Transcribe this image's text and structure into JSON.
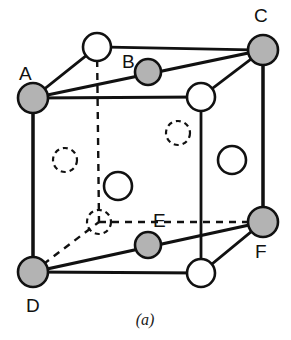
{
  "figure": {
    "caption": "(a)",
    "type": "crystal-unit-cell-diagram",
    "colors": {
      "line": "#111111",
      "shaded_atom_fill": "#b3b3b3",
      "open_atom_fill": "#ffffff",
      "background": "#ffffff"
    },
    "labels": [
      {
        "id": "label-A",
        "text": "A",
        "x": 19,
        "y": 80
      },
      {
        "id": "label-B",
        "text": "B",
        "x": 122,
        "y": 68
      },
      {
        "id": "label-C",
        "text": "C",
        "x": 254,
        "y": 22
      },
      {
        "id": "label-D",
        "text": "D",
        "x": 26,
        "y": 312
      },
      {
        "id": "label-E",
        "text": "E",
        "x": 153,
        "y": 227
      },
      {
        "id": "label-F",
        "text": "F",
        "x": 255,
        "y": 258
      }
    ],
    "atoms": [
      {
        "id": "atom-A",
        "label": "A",
        "style": "shaded",
        "cx": 33,
        "cy": 98,
        "r": 15
      },
      {
        "id": "atom-C",
        "label": "C",
        "style": "shaded",
        "cx": 263,
        "cy": 50,
        "r": 15
      },
      {
        "id": "atom-D",
        "label": "D",
        "style": "shaded",
        "cx": 33,
        "cy": 272,
        "r": 15
      },
      {
        "id": "atom-F",
        "label": "F",
        "style": "shaded",
        "cx": 263,
        "cy": 222,
        "r": 15
      },
      {
        "id": "atom-B",
        "label": "B",
        "style": "shaded",
        "cx": 148,
        "cy": 72,
        "r": 13
      },
      {
        "id": "atom-E",
        "label": "E",
        "style": "shaded",
        "cx": 148,
        "cy": 245,
        "r": 13
      },
      {
        "id": "atom-back-top-left",
        "label": "",
        "style": "open",
        "cx": 97,
        "cy": 47,
        "r": 14
      },
      {
        "id": "atom-front-top-right",
        "label": "",
        "style": "open",
        "cx": 201,
        "cy": 97,
        "r": 14
      },
      {
        "id": "atom-front-bottom-right",
        "label": "",
        "style": "open",
        "cx": 201,
        "cy": 273,
        "r": 14
      },
      {
        "id": "atom-face-right",
        "label": "",
        "style": "open",
        "cx": 232,
        "cy": 160,
        "r": 14
      },
      {
        "id": "atom-face-front",
        "label": "",
        "style": "open",
        "cx": 118,
        "cy": 186,
        "r": 14
      },
      {
        "id": "atom-face-left-hidden",
        "label": "",
        "style": "dashed",
        "cx": 65,
        "cy": 160,
        "r": 12
      },
      {
        "id": "atom-face-back-hidden",
        "label": "",
        "style": "dashed",
        "cx": 178,
        "cy": 133,
        "r": 12
      },
      {
        "id": "atom-face-bottom-hidden",
        "label": "",
        "style": "dashed",
        "cx": 99,
        "cy": 222,
        "r": 12
      }
    ],
    "edges_solid": [
      {
        "id": "edge-front-left",
        "x1": 33,
        "y1": 98,
        "x2": 33,
        "y2": 272
      },
      {
        "id": "edge-front-top",
        "x1": 33,
        "y1": 98,
        "x2": 201,
        "y2": 97
      },
      {
        "id": "edge-front-right",
        "x1": 201,
        "y1": 97,
        "x2": 201,
        "y2": 273
      },
      {
        "id": "edge-front-bottom",
        "x1": 33,
        "y1": 272,
        "x2": 201,
        "y2": 273
      },
      {
        "id": "edge-back-top",
        "x1": 97,
        "y1": 47,
        "x2": 263,
        "y2": 50
      },
      {
        "id": "edge-back-right",
        "x1": 263,
        "y1": 50,
        "x2": 263,
        "y2": 222
      },
      {
        "id": "edge-top-left-diagonal",
        "x1": 33,
        "y1": 98,
        "x2": 97,
        "y2": 47
      },
      {
        "id": "edge-top-right-diagonal",
        "x1": 201,
        "y1": 97,
        "x2": 263,
        "y2": 50
      },
      {
        "id": "edge-bottom-right-diagonal",
        "x1": 201,
        "y1": 273,
        "x2": 263,
        "y2": 222
      }
    ],
    "edges_dashed": [
      {
        "id": "edge-hidden-vertical",
        "x1": 97,
        "y1": 47,
        "x2": 99,
        "y2": 222
      },
      {
        "id": "edge-hidden-bottom-back",
        "x1": 99,
        "y1": 222,
        "x2": 263,
        "y2": 222
      },
      {
        "id": "edge-hidden-bottom-left-diagonal",
        "x1": 33,
        "y1": 272,
        "x2": 99,
        "y2": 222
      }
    ],
    "plane": {
      "id": "diagonal-plane-ACFD",
      "vertices": "33,98 263,50 263,222 33,272",
      "outline_points": [
        {
          "x": 33,
          "y": 98
        },
        {
          "x": 263,
          "y": 50
        },
        {
          "x": 263,
          "y": 222
        },
        {
          "x": 33,
          "y": 272
        }
      ]
    }
  }
}
